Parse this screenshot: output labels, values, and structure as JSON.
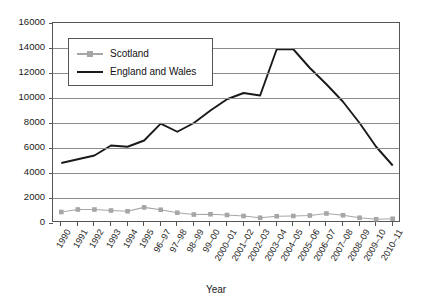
{
  "chart_data": {
    "type": "line",
    "title": "",
    "xlabel": "Year",
    "ylabel": "",
    "ylim": [
      0,
      16000
    ],
    "ytick_values": [
      0,
      2000,
      4000,
      6000,
      8000,
      10000,
      12000,
      14000,
      16000
    ],
    "ytick_labels": [
      "0",
      "2000",
      "4000",
      "6000",
      "8000",
      "10000",
      "12000",
      "14000",
      "16000"
    ],
    "grid": true,
    "legend_position": "upper-left-inside",
    "categories": [
      "1990",
      "1991",
      "1992",
      "1993",
      "1994",
      "1995",
      "96–97",
      "97–98",
      "98–99",
      "99–00",
      "2000–01",
      "2001–02",
      "2002–03",
      "2003–04",
      "2004–05",
      "2005–06",
      "2006–07",
      "2007–08",
      "2008–09",
      "2009–10",
      "2010–11"
    ],
    "series": [
      {
        "name": "Scotland",
        "color": "#a6a6a6",
        "marker": "square",
        "values": [
          880,
          1080,
          1080,
          1000,
          940,
          1250,
          1060,
          820,
          680,
          700,
          640,
          560,
          420,
          540,
          560,
          600,
          760,
          620,
          420,
          300,
          340
        ]
      },
      {
        "name": "England and Wales",
        "color": "#1a1a1a",
        "marker": "none",
        "values": [
          4800,
          5100,
          5400,
          6200,
          6100,
          6600,
          7950,
          7300,
          8000,
          9000,
          9900,
          10400,
          10200,
          13900,
          13900,
          12400,
          11100,
          9700,
          8000,
          6100,
          4600
        ]
      }
    ]
  },
  "legend": {
    "items": [
      {
        "label": "Scotland",
        "color": "#a6a6a6",
        "marker": "square"
      },
      {
        "label": "England and Wales",
        "color": "#1a1a1a",
        "marker": "none"
      }
    ]
  },
  "axes": {
    "x_title": "Year"
  }
}
